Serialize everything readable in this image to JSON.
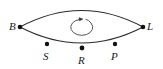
{
  "figure": {
    "name": "lens-shaped-orbit-diagram",
    "background_color": "#ffffff",
    "stroke_color": "#2b2b2b",
    "point_color": "#111111",
    "width": 163,
    "height": 69,
    "rotation_indicator": {
      "name": "clockwise-rotation-arrow",
      "direction": "clockwise",
      "center": [
        84,
        27
      ],
      "rx": 11,
      "ry": 8
    },
    "vertices": [
      {
        "id": "B",
        "label": "B",
        "point": [
          20,
          27
        ],
        "label_pos": [
          9,
          22
        ]
      },
      {
        "id": "L",
        "label": "L",
        "point": [
          143,
          27
        ],
        "label_pos": [
          147,
          22
        ]
      }
    ],
    "arc_points": [
      {
        "id": "S",
        "label": "S",
        "point": [
          47,
          44
        ],
        "label_pos": [
          43,
          51
        ]
      },
      {
        "id": "R",
        "label": "R",
        "point": [
          82,
          48
        ],
        "label_pos": [
          78,
          55
        ]
      },
      {
        "id": "P",
        "label": "P",
        "point": [
          115,
          44
        ],
        "label_pos": [
          111,
          51
        ]
      }
    ],
    "arcs": [
      {
        "id": "upper-arc",
        "from": "B",
        "to": "L",
        "apex_y": 6
      },
      {
        "id": "lower-arc",
        "from": "B",
        "to": "L",
        "apex_y": 48
      }
    ]
  }
}
